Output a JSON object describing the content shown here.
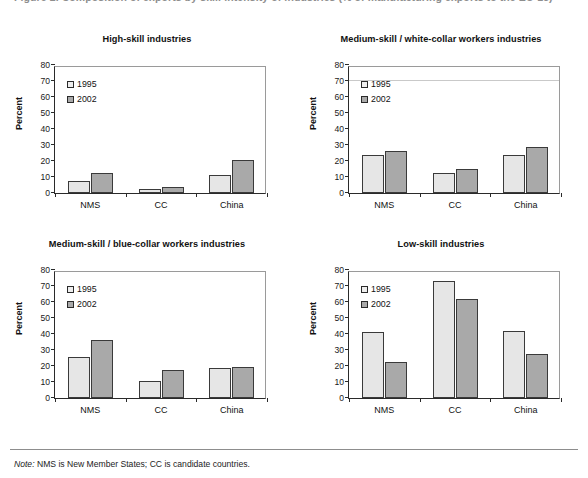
{
  "page": {
    "header_clipped": "Figure 2. Composition of exports by skill intensity of industries (% of manufacturing exports to the EU-15)",
    "note_prefix": "Note:",
    "note_text": " NMS is New Member States; CC is candidate countries."
  },
  "legend": {
    "series_1": "1995",
    "series_2": "2002"
  },
  "axis": {
    "ylabel": "Percent",
    "yticks": [
      "80",
      "70",
      "60",
      "50",
      "40",
      "30",
      "20",
      "10",
      "0"
    ],
    "xticks": [
      "NMS",
      "CC",
      "China"
    ]
  },
  "colors": {
    "series_1": "#e6e6e6",
    "series_2": "#a9a9a9",
    "outline": "#3a3a3a"
  },
  "chart_data": [
    {
      "type": "bar",
      "title": "High-skill industries",
      "categories": [
        "NMS",
        "CC",
        "China"
      ],
      "series": [
        {
          "name": "1995",
          "values": [
            7.5,
            2.5,
            11.5
          ]
        },
        {
          "name": "2002",
          "values": [
            12.5,
            3.5,
            20.5
          ]
        }
      ],
      "xlabel": "",
      "ylabel": "Percent",
      "ylim": [
        0,
        80
      ],
      "ystep": 10,
      "grid": false,
      "legend_position": "top-left"
    },
    {
      "type": "bar",
      "title": "Medium-skill / white-collar workers industries",
      "categories": [
        "NMS",
        "CC",
        "China"
      ],
      "series": [
        {
          "name": "1995",
          "values": [
            24.0,
            12.5,
            23.5
          ]
        },
        {
          "name": "2002",
          "values": [
            26.5,
            15.0,
            29.0
          ]
        }
      ],
      "xlabel": "",
      "ylabel": "Percent",
      "ylim": [
        0,
        80
      ],
      "ystep": 10,
      "grid": false,
      "legend_position": "top-left",
      "scan_artifact_line_at": 70
    },
    {
      "type": "bar",
      "title": "Medium-skill / blue-collar workers industries",
      "categories": [
        "NMS",
        "CC",
        "China"
      ],
      "series": [
        {
          "name": "1995",
          "values": [
            25.5,
            10.5,
            18.5
          ]
        },
        {
          "name": "2002",
          "values": [
            36.0,
            17.5,
            19.5
          ]
        }
      ],
      "xlabel": "",
      "ylabel": "Percent",
      "ylim": [
        0,
        80
      ],
      "ystep": 10,
      "grid": false,
      "legend_position": "top-left"
    },
    {
      "type": "bar",
      "title": "Low-skill industries",
      "categories": [
        "NMS",
        "CC",
        "China"
      ],
      "series": [
        {
          "name": "1995",
          "values": [
            41.0,
            73.0,
            42.0
          ]
        },
        {
          "name": "2002",
          "values": [
            22.5,
            62.0,
            27.5
          ]
        }
      ],
      "xlabel": "",
      "ylabel": "Percent",
      "ylim": [
        0,
        80
      ],
      "ystep": 10,
      "grid": false,
      "legend_position": "top-left"
    }
  ]
}
